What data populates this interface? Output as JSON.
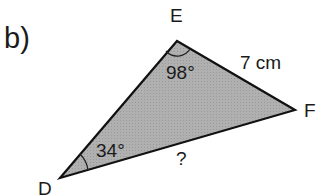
{
  "figure": {
    "part_label": "b)",
    "vertices": {
      "E": {
        "label": "E",
        "x": 177,
        "y": 41
      },
      "F": {
        "label": "F",
        "x": 295,
        "y": 110
      },
      "D": {
        "label": "D",
        "x": 60,
        "y": 178
      }
    },
    "sides": {
      "EF": "7 cm",
      "DF": "?"
    },
    "angles": {
      "E": "98°",
      "D": "34°"
    },
    "colors": {
      "fill": "#aaaaaa",
      "stroke": "#111111",
      "text": "#1a1a1a"
    }
  }
}
